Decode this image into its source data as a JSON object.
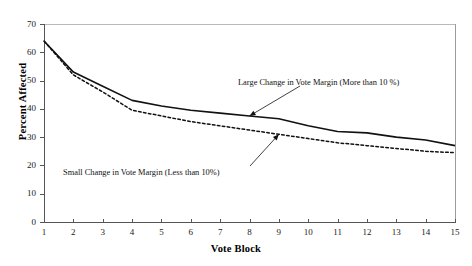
{
  "chart_data": {
    "type": "line",
    "title": "",
    "xlabel": "Vote Block",
    "ylabel": "Percent Affected",
    "xlim": [
      1,
      15
    ],
    "ylim": [
      0,
      70
    ],
    "grid": false,
    "legend_position": "inline-annotations",
    "x": [
      1,
      2,
      3,
      4,
      5,
      6,
      7,
      8,
      9,
      10,
      11,
      12,
      13,
      14,
      15
    ],
    "xticklabels": [
      "1",
      "2",
      "3",
      "4",
      "5",
      "6",
      "7",
      "8",
      "9",
      "10",
      "11",
      "12",
      "13",
      "14",
      "15"
    ],
    "yticklabels": [
      "0",
      "10",
      "20",
      "30",
      "40",
      "50",
      "60",
      "70"
    ],
    "yticks": [
      0,
      10,
      20,
      30,
      40,
      50,
      60,
      70
    ],
    "series": [
      {
        "name": "Large Change in Vote Margin (More than 10 %)",
        "style": "solid",
        "color": "#111111",
        "values": [
          64.0,
          53.0,
          48.0,
          43.0,
          41.0,
          39.5,
          38.5,
          37.5,
          36.5,
          34.0,
          32.0,
          31.5,
          30.0,
          29.0,
          27.0
        ]
      },
      {
        "name": "Small Change in Vote Margin (Less than 10%)",
        "style": "dotted",
        "color": "#111111",
        "values": [
          64.0,
          52.0,
          46.0,
          39.5,
          37.5,
          35.5,
          34.0,
          32.5,
          31.0,
          29.5,
          28.0,
          27.0,
          26.0,
          25.0,
          24.5
        ]
      }
    ],
    "annotations": [
      {
        "id": "large-change",
        "text": "Large Change in Vote Margin (More than 10 %)",
        "points_to_series": "Large Change in Vote Margin (More than 10 %)",
        "points_to_x": 8
      },
      {
        "id": "small-change",
        "text": "Small Change in Vote Margin (Less than 10%)",
        "points_to_series": "Small Change in Vote Margin (Less than 10%)",
        "points_to_x": 9
      }
    ]
  }
}
